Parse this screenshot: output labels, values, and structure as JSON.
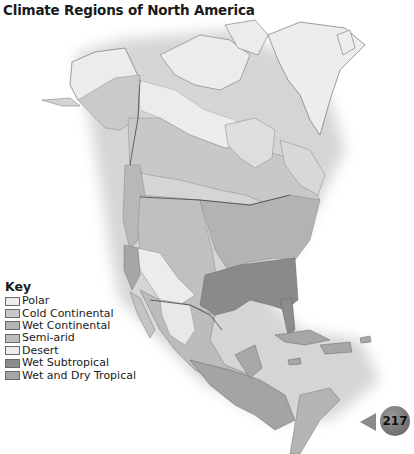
{
  "title": "Climate Regions of North America",
  "key": {
    "title": "Key",
    "items": [
      {
        "label": "Polar",
        "color": "#eeeeee"
      },
      {
        "label": "Cold Continental",
        "color": "#c9c9c9"
      },
      {
        "label": "Wet Continental",
        "color": "#b4b4b4"
      },
      {
        "label": "Semi-arid",
        "color": "#bdbdbd"
      },
      {
        "label": "Desert",
        "color": "#ececec"
      },
      {
        "label": "Wet Subtropical",
        "color": "#8c8c8c"
      },
      {
        "label": "Wet and Dry Tropical",
        "color": "#a6a6a6"
      }
    ]
  },
  "page": {
    "number": "217"
  }
}
